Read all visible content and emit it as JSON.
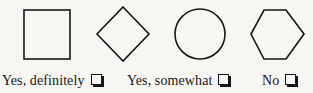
{
  "page": {
    "background_color": "#f7f6f3",
    "ink_color": "#16161a",
    "width": 313,
    "height": 93
  },
  "shapes_row": {
    "stroke_color": "#16161a",
    "fill": "none",
    "shapes": [
      {
        "name": "square",
        "icon": "square-shape-icon",
        "sides": 4,
        "x": 24,
        "y": 10,
        "width": 46,
        "height": 49
      },
      {
        "name": "diamond",
        "icon": "diamond-shape-icon",
        "sides": 4,
        "center_x": 123,
        "center_y": 34,
        "half_diagonal": 26
      },
      {
        "name": "circle",
        "icon": "circle-shape-icon",
        "sides": 0,
        "center_x": 200,
        "center_y": 34,
        "radius": 25
      },
      {
        "name": "hexagon",
        "icon": "hexagon-shape-icon",
        "sides": 6,
        "x": 251,
        "y": 10,
        "width": 53,
        "height": 49
      }
    ]
  },
  "options_row": {
    "checkbox_state": "unchecked",
    "options": [
      {
        "label": "Yes, definitely",
        "checkbox_icon": "checkbox-empty-icon"
      },
      {
        "label": "Yes, somewhat",
        "checkbox_icon": "checkbox-empty-icon"
      },
      {
        "label": "No",
        "checkbox_icon": "checkbox-empty-icon"
      }
    ]
  }
}
